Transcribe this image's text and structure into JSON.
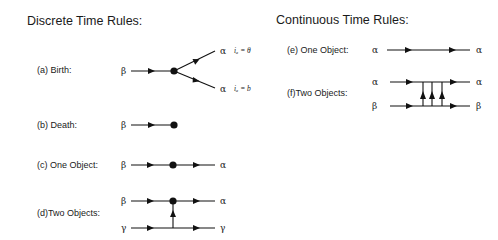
{
  "discrete": {
    "title": "Discrete Time Rules:",
    "rules": [
      {
        "id": "a",
        "label": "(a) Birth:",
        "input": "β",
        "outputs": [
          "α",
          "α"
        ],
        "output_labels": [
          "iₐ = θ",
          "iₐ = b"
        ]
      },
      {
        "id": "b",
        "label": "(b) Death:",
        "input": "β"
      },
      {
        "id": "c",
        "label": "(c) One Object:",
        "input": "β",
        "output": "α"
      },
      {
        "id": "d",
        "label": "(d)Two Objects:",
        "inputs": [
          "β",
          "γ"
        ],
        "outputs": [
          "α",
          "γ"
        ]
      }
    ]
  },
  "continuous": {
    "title": "Continuous Time Rules:",
    "rules": [
      {
        "id": "e",
        "label": "(e) One Object:",
        "input": "α",
        "output": "α"
      },
      {
        "id": "f",
        "label": "(f)Two Objects:",
        "inputs": [
          "α",
          "β"
        ],
        "outputs": [
          "α",
          "β"
        ]
      }
    ]
  }
}
